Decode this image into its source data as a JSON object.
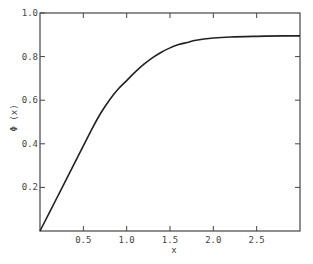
{
  "chart_data": {
    "type": "line",
    "title": "",
    "xlabel": "x",
    "ylabel": "Φ (x)",
    "xlim": [
      0,
      3.0
    ],
    "ylim": [
      0,
      1.0
    ],
    "grid": false,
    "legend": null,
    "x_ticks": [
      0.5,
      1.0,
      1.5,
      2.0,
      2.5
    ],
    "x_tick_labels": [
      "0.5",
      "1.0",
      "1.5",
      "2.0",
      "2.5"
    ],
    "y_ticks": [
      0.2,
      0.4,
      0.6,
      0.8,
      1.0
    ],
    "y_tick_labels": [
      "0.2",
      "0.4",
      "0.6",
      "0.8",
      "1.0"
    ],
    "series": [
      {
        "name": "Φ(x)",
        "color": "#222222",
        "x": [
          0,
          0.2,
          0.4,
          0.6,
          0.7,
          0.8,
          0.9,
          1.0,
          1.1,
          1.2,
          1.3,
          1.4,
          1.5,
          1.6,
          1.7,
          1.8,
          2.0,
          2.2,
          2.5,
          2.8,
          3.0
        ],
        "y": [
          0,
          0.156,
          0.312,
          0.468,
          0.54,
          0.6,
          0.65,
          0.69,
          0.73,
          0.765,
          0.795,
          0.82,
          0.84,
          0.855,
          0.865,
          0.875,
          0.885,
          0.89,
          0.893,
          0.895,
          0.895
        ]
      }
    ]
  },
  "labels": {
    "x_axis": "x",
    "y_axis": "Φ (x)"
  }
}
